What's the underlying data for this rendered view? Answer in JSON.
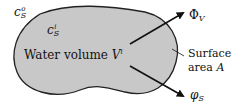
{
  "diagram": {
    "region": {
      "label": "Water volume",
      "volume_symbol": "V",
      "volume_superscript": "i",
      "fill_color": "#c8c8c8",
      "outline_color": "#222222"
    },
    "outer_concentration": {
      "symbol": "c",
      "subscript": "S",
      "superscript": "o"
    },
    "inner_concentration": {
      "symbol": "c",
      "subscript": "S",
      "superscript": "i"
    },
    "flux_volume": {
      "symbol": "Φ",
      "subscript": "V"
    },
    "flux_surface": {
      "symbol": "φ",
      "subscript": "S"
    },
    "surface_label": {
      "line1": "Surface",
      "line2_text": "area",
      "line2_symbol": "A"
    }
  }
}
